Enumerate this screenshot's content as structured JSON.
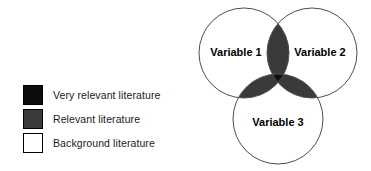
{
  "colors": {
    "very_relevant": "#0d0d0d",
    "relevant": "#3a3a3a",
    "background": "#ffffff",
    "outline": "#4d4d4d",
    "swatch_border": "#000000",
    "text": "#1a1a1a"
  },
  "legend": {
    "items": [
      {
        "swatch_name": "swatch-very-relevant",
        "label": "Very relevant literature",
        "fill": "#0d0d0d"
      },
      {
        "swatch_name": "swatch-relevant",
        "label": "Relevant literature",
        "fill": "#3a3a3a"
      },
      {
        "swatch_name": "swatch-background",
        "label": "Background literature",
        "fill": "#ffffff"
      }
    ]
  },
  "venn": {
    "circles": [
      {
        "id": "variable-1",
        "label": "Variable 1",
        "cx": 48,
        "cy": 49,
        "r": 45,
        "label_x": 40,
        "label_y": 49
      },
      {
        "id": "variable-2",
        "label": "Variable 2",
        "cx": 116,
        "cy": 49,
        "r": 45,
        "label_x": 124,
        "label_y": 49
      },
      {
        "id": "variable-3",
        "label": "Variable 3",
        "cx": 82,
        "cy": 115,
        "r": 45,
        "label_x": 82,
        "label_y": 119
      }
    ],
    "regions": [
      {
        "id": "overlap-1-2",
        "fill": "#3a3a3a",
        "meaning": "Relevant literature"
      },
      {
        "id": "overlap-1-3",
        "fill": "#3a3a3a",
        "meaning": "Relevant literature"
      },
      {
        "id": "overlap-2-3",
        "fill": "#3a3a3a",
        "meaning": "Relevant literature"
      },
      {
        "id": "overlap-1-2-3",
        "fill": "#0d0d0d",
        "meaning": "Very relevant literature"
      },
      {
        "id": "circle-only",
        "fill": "#ffffff",
        "meaning": "Background literature"
      }
    ]
  },
  "chart_data": {
    "type": "venn",
    "title": "",
    "sets": [
      "Variable 1",
      "Variable 2",
      "Variable 3"
    ],
    "set_count": 3,
    "regions": [
      {
        "sets": [
          "Variable 1"
        ],
        "shading": "white",
        "category": "Background literature"
      },
      {
        "sets": [
          "Variable 2"
        ],
        "shading": "white",
        "category": "Background literature"
      },
      {
        "sets": [
          "Variable 3"
        ],
        "shading": "white",
        "category": "Background literature"
      },
      {
        "sets": [
          "Variable 1",
          "Variable 2"
        ],
        "shading": "dark gray",
        "category": "Relevant literature"
      },
      {
        "sets": [
          "Variable 1",
          "Variable 3"
        ],
        "shading": "dark gray",
        "category": "Relevant literature"
      },
      {
        "sets": [
          "Variable 2",
          "Variable 3"
        ],
        "shading": "dark gray",
        "category": "Relevant literature"
      },
      {
        "sets": [
          "Variable 1",
          "Variable 2",
          "Variable 3"
        ],
        "shading": "black",
        "category": "Very relevant literature"
      }
    ],
    "legend": {
      "position": "left",
      "entries": [
        {
          "label": "Very relevant literature",
          "color": "#0d0d0d"
        },
        {
          "label": "Relevant literature",
          "color": "#3a3a3a"
        },
        {
          "label": "Background literature",
          "color": "#ffffff"
        }
      ]
    },
    "grid": false,
    "xlabel": "",
    "ylabel": ""
  }
}
